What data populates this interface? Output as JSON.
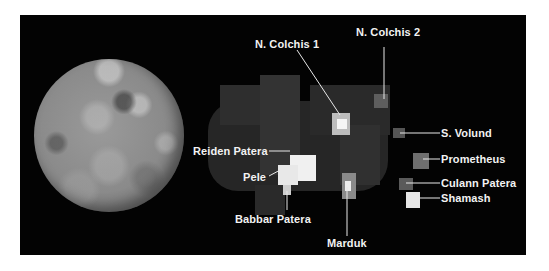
{
  "figure": {
    "left_panel": {
      "description": "Visible-light globe image of Io"
    },
    "right_panel": {
      "description": "Thermal emission map showing hot spots",
      "hotspots": [
        {
          "name": "N. Colchis 1"
        },
        {
          "name": "N. Colchis 2"
        },
        {
          "name": "S. Volund"
        },
        {
          "name": "Prometheus"
        },
        {
          "name": "Culann Patera"
        },
        {
          "name": "Shamash"
        },
        {
          "name": "Reiden Patera"
        },
        {
          "name": "Pele"
        },
        {
          "name": "Babbar Patera"
        },
        {
          "name": "Marduk"
        }
      ]
    },
    "colors": {
      "background": "#ffffff",
      "panel": "#030303",
      "label": "#f2f2f2"
    }
  }
}
